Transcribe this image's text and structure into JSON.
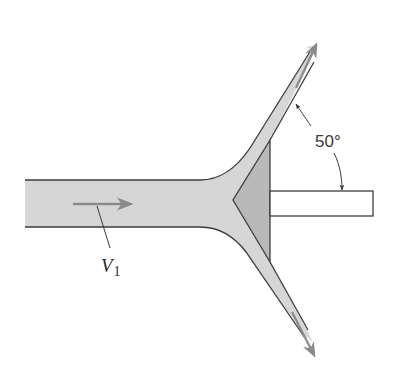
{
  "figure": {
    "labels": {
      "angle": "50°",
      "velocity_symbol": "V",
      "velocity_subscript": "1"
    },
    "colors": {
      "jet_fill": "#d6d6d6",
      "deflector_fill": "#b9b9b9",
      "rod_fill": "#ffffff",
      "outline": "#3c3c3c",
      "flow_arrow": "#8a8a8a",
      "annotation": "#3a3a3a"
    },
    "elements": {
      "jet": "Incoming horizontal jet",
      "deflector": "Conical deflector",
      "rod": "Support rod",
      "upper_sheet": "Upper deflected sheet",
      "lower_sheet": "Lower deflected sheet",
      "angle_arc": "Deflection angle indicator"
    }
  }
}
